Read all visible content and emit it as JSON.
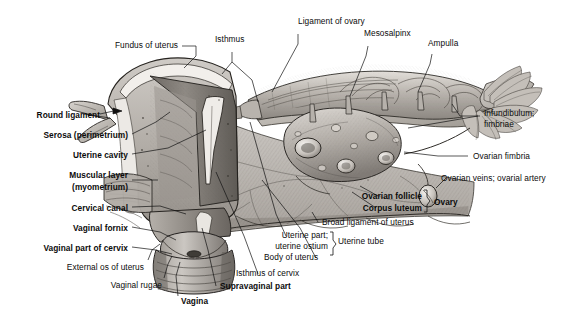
{
  "figure": {
    "style": "grayscale anatomical pencil illustration",
    "background": "#ffffff",
    "ink": "#111111"
  },
  "labels": {
    "fundus_of_uterus": "Fundus of uterus",
    "isthmus": "Isthmus",
    "ligament_of_ovary": "Ligament of ovary",
    "mesosalpinx": "Mesosalpinx",
    "ampulla": "Ampulla",
    "infundibulum_fimbriae_1": "Infundibulum;",
    "infundibulum_fimbriae_2": "fimbriae",
    "ovarian_fimbria": "Ovarian fimbria",
    "ovarian_veins_artery": "Ovarian veins; ovarial artery",
    "ovarian_follicle": "Ovarian follicle",
    "corpus_luteum": "Corpus luteum",
    "ovary": "Ovary",
    "broad_ligament_of_uterus": "Broad ligament of uterus",
    "uterine_part_1": "Uterine part;",
    "uterine_part_2": "uterine ostium",
    "uterine_tube": "Uterine tube",
    "body_of_uterus": "Body of uterus",
    "isthmus_of_cervix": "Isthmus of cervix",
    "supravaginal_part": "Supravaginal part",
    "vagina": "Vagina",
    "vaginal_rugae": "Vaginal rugae",
    "external_os_of_uterus": "External os of uterus",
    "vaginal_part_of_cervix": "Vaginal part of cervix",
    "vaginal_fornix": "Vaginal fornix",
    "cervical_canal": "Cervical canal",
    "muscular_layer_1": "Muscular layer",
    "muscular_layer_2": "(myometrium)",
    "uterine_cavity": "Uterine cavity",
    "serosa_perimetrium": "Serosa (perimetrium)",
    "round_ligament": "Round ligament"
  }
}
